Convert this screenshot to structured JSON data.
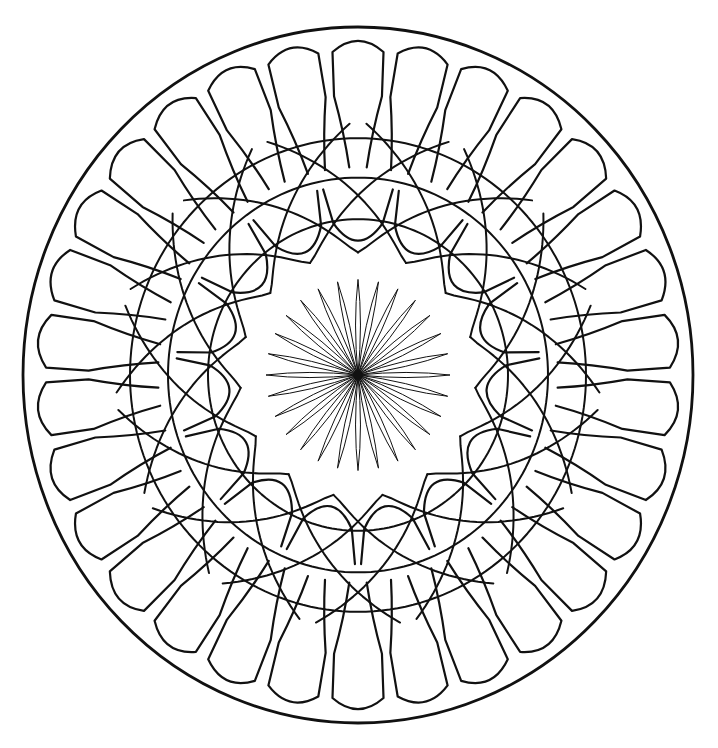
{
  "page": {
    "kind": "line-art-mandala",
    "width": 718,
    "height": 748,
    "background_color": "#ffffff",
    "ink_color": "#111111"
  },
  "geometry": {
    "center_x": 358,
    "center_y": 375,
    "outer_radius_x": 335,
    "outer_radius_y": 348
  },
  "rings": [
    {
      "name": "outer-rim",
      "label": "Outer boundary circle",
      "type": "circle",
      "radius_x": 335,
      "radius_y": 348,
      "stroke_width": 2.8,
      "count": 1
    },
    {
      "name": "outer-petal-ring",
      "label": "Outer ring of rounded finger petals",
      "type": "petal-ring",
      "count": 30,
      "tip_radius": 312,
      "base_radius": 200,
      "tip_width_deg": 10.2,
      "base_width_deg": 5.0,
      "stroke_width": 2.2
    },
    {
      "name": "lattice-ring",
      "label": "Woven counter-rotating spiral lattice",
      "type": "spiral-lattice",
      "arms_clockwise": 15,
      "arms_counterclockwise": 15,
      "inner_radius": 118,
      "outer_radius": 242,
      "twist_deg": 46,
      "stroke_width": 2.0,
      "concentric_arc_count": 3,
      "concentric_arc_radii": [
        150,
        190,
        228
      ]
    },
    {
      "name": "inner-petal-ring",
      "label": "Inner ring of teardrop petals pointing to center",
      "type": "teardrop-ring",
      "count": 15,
      "bulb_radius": 124,
      "bulb_size": 30,
      "base_radius": 182,
      "stroke_width": 2.2
    },
    {
      "name": "core-flower",
      "label": "Central daisy flower",
      "type": "needle-petal-flower",
      "count": 28,
      "tip_radius": 92,
      "petal_half_width_deg": 5.6,
      "stroke_width": 1.0,
      "hub_radius": 4.5,
      "hub_color": "#111111"
    }
  ]
}
